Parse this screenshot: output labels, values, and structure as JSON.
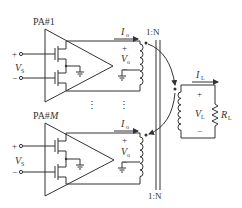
{
  "colors": {
    "line": "#333333",
    "background": "#ffffff"
  },
  "amplifiers": [
    {
      "label": "PA#1",
      "input": {
        "plus": "+",
        "minus": "−",
        "voltage_main": "V",
        "voltage_sub": "S"
      },
      "output": {
        "current_main": "I",
        "current_sub": "o",
        "voltage_main": "V",
        "voltage_sub": "o",
        "plus": "+",
        "minus": "−"
      },
      "ratio": "1:N"
    },
    {
      "label_main": "PA#",
      "label_idx": "M",
      "input": {
        "plus": "+",
        "minus": "−",
        "voltage_main": "V",
        "voltage_sub": "S"
      },
      "output": {
        "current_main": "I",
        "current_sub": "o",
        "voltage_main": "V",
        "voltage_sub": "o",
        "plus": "+",
        "minus": "−"
      },
      "ratio": "1:N"
    }
  ],
  "ellipsis": "⋮",
  "load": {
    "current_main": "I",
    "current_sub": "L",
    "voltage_main": "V",
    "voltage_sub": "L",
    "resistor_main": "R",
    "resistor_sub": "L",
    "plus": "+",
    "minus": "−"
  }
}
